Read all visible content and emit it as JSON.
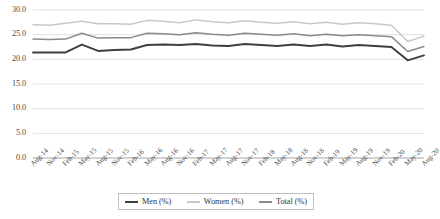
{
  "chart_data": {
    "type": "line",
    "title": "",
    "xlabel": "",
    "ylabel": "",
    "ylim": [
      0.0,
      30.0
    ],
    "ytick_step": 5.0,
    "grid": true,
    "legend_position": "bottom",
    "ytick_labels": [
      "30.0",
      "25.0",
      "20.0",
      "15.0",
      "10.0",
      "5.0",
      "0.0"
    ],
    "ytick_values": [
      30.0,
      25.0,
      20.0,
      15.0,
      10.0,
      5.0,
      0.0
    ],
    "categories": [
      "Aug-14",
      "Nov-14",
      "Feb-15",
      "May-15",
      "Aug-15",
      "Nov-15",
      "Feb-16",
      "May-16",
      "Aug-16",
      "Nov-16",
      "Feb-17",
      "May-17",
      "Aug-17",
      "Nov-17",
      "Feb-18",
      "May-18",
      "Aug-18",
      "Nov-18",
      "Feb-19",
      "May-19",
      "Aug-19",
      "Nov-19",
      "Feb-20",
      "May-20",
      "Aug-20"
    ],
    "series": [
      {
        "name": "Men (%)",
        "color": "#3f3f3f",
        "width": 1.9,
        "values": [
          21.4,
          21.4,
          21.4,
          23.0,
          21.7,
          21.9,
          22.0,
          22.9,
          23.0,
          22.9,
          23.1,
          22.8,
          22.7,
          23.1,
          22.9,
          22.7,
          23.0,
          22.7,
          23.0,
          22.6,
          22.9,
          22.7,
          22.5,
          19.8,
          20.8
        ]
      },
      {
        "name": "Women (%)",
        "color": "#c8c8c8",
        "width": 1.5,
        "values": [
          27.0,
          26.9,
          27.3,
          27.7,
          27.2,
          27.2,
          27.1,
          27.9,
          27.7,
          27.4,
          28.0,
          27.6,
          27.4,
          27.8,
          27.5,
          27.3,
          27.6,
          27.2,
          27.5,
          27.1,
          27.4,
          27.2,
          26.9,
          23.6,
          24.7
        ]
      },
      {
        "name": "Total (%)",
        "color": "#8a8a8a",
        "width": 1.5,
        "values": [
          24.1,
          24.0,
          24.1,
          25.3,
          24.3,
          24.4,
          24.4,
          25.3,
          25.2,
          25.0,
          25.4,
          25.1,
          24.9,
          25.3,
          25.1,
          24.9,
          25.2,
          24.8,
          25.1,
          24.8,
          25.0,
          24.8,
          24.6,
          21.6,
          22.6
        ]
      }
    ]
  },
  "legend": {
    "items": [
      {
        "label": "Men (%)",
        "color": "#3f3f3f"
      },
      {
        "label": "Women (%)",
        "color": "#c8c8c8"
      },
      {
        "label": "Total (%)",
        "color": "#8a8a8a"
      }
    ]
  },
  "axis_colors": {
    "gridline": "#d9d9d9",
    "baseline": "#a6a6a6",
    "tick_text": "#4a4a4a"
  }
}
